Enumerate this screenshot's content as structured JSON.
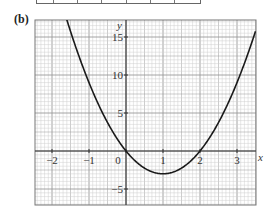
{
  "part_label": "(b)",
  "chart_data": {
    "type": "line",
    "title": "",
    "function": "y = 3x^2 - 6x",
    "xlabel": "x",
    "ylabel": "y",
    "xlim": [
      -2.45,
      3.5
    ],
    "ylim": [
      -7,
      17.5
    ],
    "grid": true,
    "x_ticks": [
      -2,
      -1,
      0,
      1,
      2,
      3
    ],
    "x_tick_labels": [
      "−2",
      "−1",
      "0",
      "1",
      "2",
      "3"
    ],
    "y_ticks": [
      15,
      10,
      5,
      -5
    ],
    "y_tick_labels": [
      "15",
      "10",
      "5",
      "−5"
    ],
    "series": [
      {
        "name": "curve",
        "x": [
          -2,
          -1.5,
          -1,
          -0.5,
          0,
          0.5,
          1,
          1.5,
          2,
          2.5,
          3,
          3.5
        ],
        "values": [
          24,
          15.75,
          9,
          3.75,
          0,
          -2.25,
          -3,
          -2.25,
          0,
          3.75,
          9,
          15.75
        ]
      }
    ],
    "key_points": {
      "roots": [
        0,
        2
      ],
      "vertex": [
        1,
        -3
      ]
    }
  }
}
